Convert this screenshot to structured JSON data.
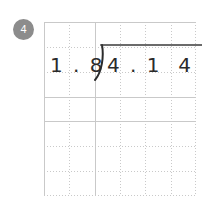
{
  "worksheet": {
    "problem_number": "4",
    "background_color": "#ffffff",
    "badge_color": "#8c8c8c",
    "badge_text_color": "#ffffff",
    "grid": {
      "line_color": "#c9c9c9",
      "style": "dotted",
      "columns": 6,
      "rows": 7,
      "cell_width_px": 25,
      "cell_height_px": 25
    },
    "problem": {
      "operation": "long-division",
      "divisor": "1 . 8",
      "divisor_value": "1.8",
      "dividend": "4 . 1  4",
      "dividend_value": "4.14",
      "quotient": "",
      "bracket_symbol": ")",
      "vinculum_color": "#3a3a3a",
      "digit_color": "#2b2b2b"
    }
  }
}
